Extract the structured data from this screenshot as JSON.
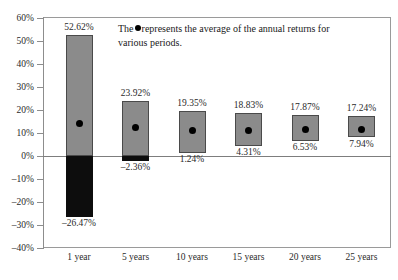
{
  "annotation": {
    "text_before": "The",
    "text_after": "represents the average of the annual returns for various periods.",
    "dot_icon": "filled-circle-icon"
  },
  "axis": {
    "y_ticks": [
      "60%",
      "50%",
      "40%",
      "30%",
      "20%",
      "10%",
      "0%",
      "–10%",
      "–20%",
      "–30%",
      "–40%"
    ],
    "y_values": [
      60,
      50,
      40,
      30,
      20,
      10,
      0,
      -10,
      -20,
      -30,
      -40
    ]
  },
  "colors": {
    "bar_positive": "#8b8b8b",
    "bar_negative": "#0d0d0d",
    "dot": "#000000",
    "axis": "#8d8d8d",
    "text": "#1a1a1a"
  },
  "chart_data": {
    "type": "bar",
    "title": "",
    "subtitle": "",
    "xlabel": "",
    "ylabel": "",
    "ylim": [
      -40,
      60
    ],
    "grid": false,
    "legend": "none",
    "note": "Floating high-low range bars; dot marks the average annual return for each period.",
    "categories": [
      "1 year",
      "5 years",
      "10 years",
      "15 years",
      "20 years",
      "25 years"
    ],
    "series": [
      {
        "name": "High",
        "values": [
          52.62,
          23.92,
          19.35,
          18.83,
          17.87,
          17.24
        ]
      },
      {
        "name": "Low",
        "values": [
          -26.47,
          -2.36,
          1.24,
          4.31,
          6.53,
          7.94
        ]
      },
      {
        "name": "Average",
        "values": [
          14.0,
          12.3,
          11.2,
          11.3,
          11.4,
          11.6
        ]
      }
    ],
    "high_labels": [
      "52.62%",
      "23.92%",
      "19.35%",
      "18.83%",
      "17.87%",
      "17.24%"
    ],
    "low_labels": [
      "–26.47%",
      "–2.36%",
      "1.24%",
      "4.31%",
      "6.53%",
      "7.94%"
    ]
  }
}
